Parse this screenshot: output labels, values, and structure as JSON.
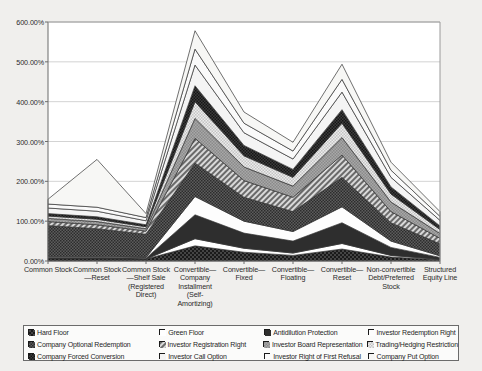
{
  "chart_data": {
    "type": "area",
    "stacked": true,
    "title": "",
    "xlabel": "",
    "ylabel": "",
    "ylim": [
      0,
      600
    ],
    "ytick_labels": [
      "0.00%",
      "100.00%",
      "200.00%",
      "300.00%",
      "400.00%",
      "500.00%",
      "600.00%"
    ],
    "ytick_values": [
      0,
      100,
      200,
      300,
      400,
      500,
      600
    ],
    "grid": true,
    "legend_position": "bottom",
    "legend_columns": 4,
    "categories": [
      "Common Stock",
      "Common Stock—Reset",
      "Common Stock—Shelf Sale (Registered Direct)",
      "Convertible—Company Installment (Self-Amortizing)",
      "Convertible—Fixed",
      "Convertible—Floating",
      "Convertible—Reset",
      "Non-convertible Debt/Preferred Stock",
      "Structured Equity Line"
    ],
    "series": [
      {
        "name": "Hard Floor",
        "values": [
          6,
          6,
          5,
          38,
          22,
          14,
          30,
          10,
          3
        ]
      },
      {
        "name": "Green Floor",
        "values": [
          0,
          0,
          0,
          18,
          10,
          6,
          14,
          4,
          1
        ]
      },
      {
        "name": "Antidilution Protection",
        "values": [
          3,
          3,
          2,
          60,
          38,
          30,
          52,
          20,
          5
        ]
      },
      {
        "name": "Investor Redemption Right",
        "values": [
          2,
          2,
          2,
          46,
          30,
          24,
          40,
          16,
          4
        ]
      },
      {
        "name": "Company Optional Redemption",
        "values": [
          78,
          70,
          58,
          84,
          60,
          50,
          74,
          46,
          30
        ]
      },
      {
        "name": "Investor Registration Right",
        "values": [
          10,
          10,
          8,
          62,
          42,
          36,
          56,
          28,
          14
        ]
      },
      {
        "name": "Investor Board Representation",
        "values": [
          8,
          8,
          6,
          50,
          34,
          28,
          44,
          24,
          12
        ]
      },
      {
        "name": "Trading/Hedging Restriction",
        "values": [
          6,
          6,
          5,
          42,
          28,
          22,
          36,
          20,
          10
        ]
      },
      {
        "name": "Company Forced Conversion",
        "values": [
          6,
          6,
          5,
          40,
          26,
          20,
          34,
          18,
          9
        ]
      },
      {
        "name": "Investor Call Option",
        "values": [
          14,
          14,
          10,
          52,
          32,
          26,
          44,
          24,
          14
        ]
      },
      {
        "name": "Investor Right of First Refusal",
        "values": [
          10,
          10,
          8,
          40,
          24,
          20,
          32,
          18,
          10
        ]
      },
      {
        "name": "Company Put Option",
        "values": [
          12,
          120,
          10,
          46,
          28,
          22,
          38,
          20,
          12
        ]
      }
    ],
    "patterns": [
      "solid-black",
      "white",
      "solid-dark",
      "white-outline",
      "dense-mid-dark",
      "diag-mid",
      "dense-mid",
      "checker-light",
      "dense-dark",
      "light-solid",
      "white-light",
      "very-light"
    ]
  },
  "legend": {
    "items": [
      {
        "label": "Hard Floor",
        "swatch": "solid-black"
      },
      {
        "label": "Green Floor",
        "swatch": "white"
      },
      {
        "label": "Antidilution Protection",
        "swatch": "solid-dark"
      },
      {
        "label": "Investor Redemption Right",
        "swatch": "white-outline"
      },
      {
        "label": "Company Optional Redemption",
        "swatch": "dense-mid-dark"
      },
      {
        "label": "Investor Registration Right",
        "swatch": "diag-mid"
      },
      {
        "label": "Investor Board Representation",
        "swatch": "dense-mid"
      },
      {
        "label": "Trading/Hedging Restriction",
        "swatch": "checker-light"
      },
      {
        "label": "Company Forced Conversion",
        "swatch": "dense-dark"
      },
      {
        "label": "Investor Call Option",
        "swatch": "light-solid"
      },
      {
        "label": "Investor Right of First Refusal",
        "swatch": "white-light"
      },
      {
        "label": "Company Put Option",
        "swatch": "very-light"
      }
    ]
  },
  "colors": {
    "background": "#f0efed",
    "plot_background": "#ffffff",
    "axis": "#6b6b6b",
    "grid": "#c8c8c8",
    "text": "#2b2b2b"
  }
}
